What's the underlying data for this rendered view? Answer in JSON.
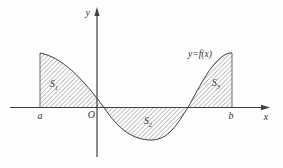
{
  "labels": {
    "y_axis": "y",
    "x_axis": "x",
    "origin": "O",
    "left_bound": "a",
    "right_bound": "b",
    "curve": "y=f(x)"
  },
  "regions": {
    "s1": {
      "base": "S",
      "sub": "1"
    },
    "s2": {
      "base": "S",
      "sub": "2"
    },
    "s3": {
      "base": "S",
      "sub": "3"
    }
  },
  "colors": {
    "stroke": "#3f3f3f",
    "thin_stroke": "#5a5a5a",
    "hatch": "#8a8a8a",
    "text": "#333333",
    "background": "#fdfdfd"
  }
}
